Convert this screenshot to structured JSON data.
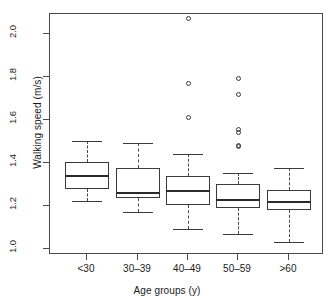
{
  "chart_data": {
    "type": "box",
    "title": "",
    "xlabel": "Age groups (y)",
    "ylabel": "Walking speed (m/s)",
    "categories": [
      "<30",
      "30–39",
      "40–49",
      "50–59",
      ">60"
    ],
    "ylim": [
      0.98,
      2.09
    ],
    "yticks": [
      1.0,
      1.2,
      1.4,
      1.6,
      1.8,
      2.0
    ],
    "ytick_labels": [
      "1.0",
      "1.2",
      "1.4",
      "1.6",
      "1.8",
      "2.0"
    ],
    "grid": false,
    "legend": null,
    "boxes": [
      {
        "category": "<30",
        "whisker_low": 1.22,
        "q1": 1.28,
        "median": 1.34,
        "q3": 1.405,
        "whisker_high": 1.5,
        "outliers": []
      },
      {
        "category": "30–39",
        "whisker_low": 1.17,
        "q1": 1.235,
        "median": 1.26,
        "q3": 1.375,
        "whisker_high": 1.49,
        "outliers": []
      },
      {
        "category": "40–49",
        "whisker_low": 1.09,
        "q1": 1.205,
        "median": 1.27,
        "q3": 1.34,
        "whisker_high": 1.44,
        "outliers": [
          2.07,
          1.77,
          1.61
        ]
      },
      {
        "category": "50–59",
        "whisker_low": 1.07,
        "q1": 1.19,
        "median": 1.225,
        "q3": 1.3,
        "whisker_high": 1.35,
        "outliers": [
          1.79,
          1.715,
          1.555,
          1.54,
          1.48,
          1.475
        ]
      },
      {
        "category": ">60",
        "whisker_low": 1.03,
        "q1": 1.18,
        "median": 1.215,
        "q3": 1.275,
        "whisker_high": 1.375,
        "outliers": []
      }
    ]
  },
  "axis": {
    "tick_color": "#4a4a4a",
    "frame_color": "#4a4a4a",
    "box_color": "#3a3a3a",
    "median_color": "#2b2b2b"
  }
}
